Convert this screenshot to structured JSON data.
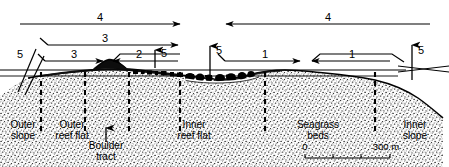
{
  "figure": {
    "type": "coral-reef-cross-section-profile",
    "title": "",
    "background_color": "#ffffff",
    "line_color": "#000000"
  },
  "transport_arrows": [
    {
      "id": "top-left-4",
      "label": "4",
      "direction": "right",
      "x1": 20,
      "x2": 180,
      "y": 24,
      "label_x": 100,
      "label_y": 12
    },
    {
      "id": "top-right-4",
      "label": "4",
      "direction": "left",
      "x1": 430,
      "x2": 226,
      "y": 24,
      "label_x": 328,
      "label_y": 12
    },
    {
      "id": "second-3",
      "label": "3",
      "direction": "right",
      "x1": 48,
      "x2": 178,
      "y": 45,
      "label_x": 105,
      "label_y": 33
    },
    {
      "id": "third-3",
      "label": "3",
      "direction": "right",
      "x1": 45,
      "x2": 103,
      "y": 61,
      "label_x": 74,
      "label_y": 49
    },
    {
      "id": "third-2",
      "label": "2",
      "direction": "left",
      "x1": 178,
      "x2": 113,
      "y": 61,
      "label_x": 139,
      "label_y": 49
    },
    {
      "id": "right-1-a",
      "label": "1",
      "direction": "right",
      "x1": 225,
      "x2": 300,
      "y": 61,
      "label_x": 265,
      "label_y": 49
    },
    {
      "id": "right-1-b",
      "label": "1",
      "direction": "left",
      "x1": 390,
      "x2": 312,
      "y": 61,
      "label_x": 352,
      "label_y": 49
    }
  ],
  "vertical_arrows": [
    {
      "id": "boulder-tract-up",
      "label": "5",
      "x": 155,
      "y1": 68,
      "y2": 50,
      "label_x": 161,
      "label_y": 48
    },
    {
      "id": "inner-reef-flat-up",
      "label": "5",
      "x": 210,
      "y1": 76,
      "y2": 46,
      "label_x": 216,
      "label_y": 45
    },
    {
      "id": "inner-slope-up",
      "label": "5",
      "x": 412,
      "y1": 80,
      "y2": 45,
      "label_x": 418,
      "label_y": 45
    }
  ],
  "outer_slope_marker": {
    "label": "5",
    "label_x": 20,
    "label_y": 49
  },
  "boulder_tract_pointer": {
    "icon": "up-arrow-icon",
    "x": 106,
    "y1": 142,
    "y2": 128
  },
  "zone_labels": [
    {
      "id": "outer-slope",
      "line1": "Outer",
      "line2": "slope",
      "x": 23,
      "y": 120
    },
    {
      "id": "outer-reef-flat",
      "line1": "Outer",
      "line2": "reef flat",
      "x": 72,
      "y": 120
    },
    {
      "id": "boulder-tract",
      "line1": "Boulder",
      "line2": "tract",
      "x": 106,
      "y": 141
    },
    {
      "id": "inner-reef-flat",
      "line1": "Inner",
      "line2": "reef flat",
      "x": 194,
      "y": 120
    },
    {
      "id": "seagrass-beds",
      "line1": "Seagrass",
      "line2": "beds",
      "x": 318,
      "y": 120
    },
    {
      "id": "inner-slope",
      "line1": "Inner",
      "line2": "slope",
      "x": 415,
      "y": 120
    }
  ],
  "zone_dividers": [
    41,
    85,
    129,
    180,
    265,
    375
  ],
  "scale_bar": {
    "left_label": "0",
    "right_label": "300 m",
    "x1": 305,
    "x2": 390,
    "y": 158,
    "ticks": [
      305,
      333,
      361,
      390
    ]
  },
  "chart_data": {
    "type": "profile-cross-section",
    "zones": [
      "Outer slope",
      "Outer reef flat",
      "Boulder tract",
      "Inner reef flat",
      "Seagrass beds",
      "Inner slope"
    ],
    "pathway_labels": [
      "1",
      "2",
      "3",
      "4",
      "5"
    ],
    "horizontal_scale": {
      "min": 0,
      "max": 300,
      "unit": "m"
    }
  }
}
